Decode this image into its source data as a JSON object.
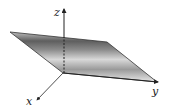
{
  "diagram": {
    "type": "3d-coordinate-plane",
    "axes": {
      "x": {
        "label": "x"
      },
      "y": {
        "label": "y"
      },
      "z": {
        "label": "z"
      }
    },
    "plane": {
      "shape": "parallelogram",
      "fill_light": "#e6e6e6",
      "fill_dark": "#5a5a5a",
      "edge_color": "#333333"
    },
    "colors": {
      "axis": "#222222",
      "background": "#ffffff"
    }
  }
}
